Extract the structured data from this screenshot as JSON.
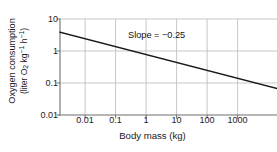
{
  "chart_data": {
    "type": "line",
    "title": "",
    "xlabel": "Body mass (kg)",
    "ylabel_line1": "Oxygen consumption",
    "ylabel_line2_prefix": "(liter O",
    "ylabel_line2_sub": "2",
    "ylabel_line2_mid": " kg",
    "ylabel_line2_sup1": "−1",
    "ylabel_line2_mid2": " h",
    "ylabel_line2_sup2": "−1",
    "ylabel_line2_suffix": ")",
    "ylabel_full": "Oxygen consumption (liter O2 kg-1 h-1)",
    "xscale": "log",
    "yscale": "log",
    "xlim": [
      0.0018,
      5000
    ],
    "ylim": [
      0.01,
      10
    ],
    "xticks": [
      "0.01",
      "0.1",
      "1",
      "10",
      "100",
      "1000"
    ],
    "xtick_values": [
      0.01,
      0.1,
      1,
      10,
      100,
      1000
    ],
    "yticks": [
      "10",
      "1",
      "0.1",
      "0.01"
    ],
    "ytick_values": [
      10,
      1,
      0.1,
      0.01
    ],
    "grid": true,
    "grid_color": "#b9b9b9",
    "legend": null,
    "line_color": "#1a1a1a",
    "annotations": [
      {
        "text": "Slope = −0.25",
        "x": 1.2,
        "y": 2.1
      }
    ],
    "series": [
      {
        "name": "Mass-specific oxygen consumption",
        "slope": -0.25,
        "intercept_log10": -0.25,
        "x": [
          0.0018,
          0.01,
          0.1,
          1,
          10,
          100,
          1000,
          5000
        ],
        "values": [
          3.86,
          1.78,
          1.0,
          0.562,
          0.316,
          0.178,
          0.1,
          0.0669
        ]
      }
    ]
  },
  "annotation_text": "Slope = −0.25",
  "axes": {
    "x_title": "Body mass (kg)",
    "y_title_line1": "Oxygen consumption",
    "y_title_line2": "(liter O₂ kg⁻¹ h⁻¹)"
  },
  "ticks": {
    "x": [
      "0.01",
      "0.1",
      "1",
      "10",
      "100",
      "1000"
    ],
    "y": [
      "10",
      "1",
      "0.1",
      "0.01"
    ]
  },
  "colors": {
    "grid": "#b9b9b9",
    "axis": "#6f6f6f",
    "line": "#1a1a1a",
    "text": "#1a1a1a",
    "background": "#ffffff"
  }
}
